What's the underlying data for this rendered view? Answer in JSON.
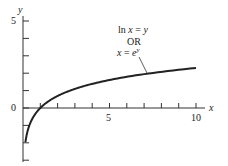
{
  "chart_data": {
    "type": "line",
    "title": "",
    "xlabel": "x",
    "ylabel": "y",
    "x_ticks": [
      1,
      2,
      3,
      4,
      5,
      6,
      7,
      8,
      9,
      10
    ],
    "x_tick_labels": {
      "5": "5",
      "10": "10"
    },
    "y_ticks": [
      -3,
      -2,
      -1,
      0,
      1,
      2,
      3,
      4,
      5
    ],
    "y_tick_labels": {
      "0": "0",
      "5": "5"
    },
    "xlim": [
      0,
      10.5
    ],
    "ylim": [
      -3,
      5.5
    ],
    "grid": false,
    "series": [
      {
        "name": "ln x = y  OR  x = e^y",
        "function": "y = ln(x)",
        "x": [
          0.14,
          0.25,
          0.5,
          1,
          2,
          3,
          4,
          5,
          6,
          7,
          8,
          9,
          10
        ],
        "values": [
          -1.97,
          -1.39,
          -0.69,
          0,
          0.69,
          1.1,
          1.39,
          1.61,
          1.79,
          1.95,
          2.08,
          2.2,
          2.3
        ]
      }
    ],
    "annotations": [
      {
        "text_line1": "ln x = y",
        "text_line2": "OR",
        "text_line3": "x = e^y",
        "points_to_x": 6.5
      }
    ]
  },
  "labels": {
    "y_axis": "y",
    "x_axis": "x",
    "y5": "5",
    "y0": "0",
    "x5": "5",
    "x10": "10",
    "ann1_pre": "ln ",
    "ann1_var": "x",
    "ann1_post": " = ",
    "ann1_y": "y",
    "ann2": "OR",
    "ann3_x": "x",
    "ann3_eq": " = ",
    "ann3_e": "e",
    "ann3_sup": "y"
  }
}
